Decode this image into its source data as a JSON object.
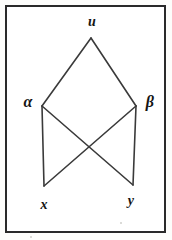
{
  "figure": {
    "type": "graph-diagram",
    "background_color": "#ffffff",
    "frame": {
      "border_color": "#2a2a2a",
      "border_width_px": 2,
      "x": 5,
      "y": 5,
      "width": 161,
      "height": 228
    },
    "edge_color": "#3a3a3a",
    "edge_width_px": 1.6,
    "nodes": [
      {
        "id": "u",
        "label": "u",
        "script": "latin",
        "x": 91,
        "y": 38,
        "label_x": 92,
        "label_y": 22
      },
      {
        "id": "alpha",
        "label": "α",
        "script": "greek",
        "x": 42,
        "y": 106,
        "label_x": 28,
        "label_y": 102
      },
      {
        "id": "beta",
        "label": "β",
        "script": "greek",
        "x": 136,
        "y": 106,
        "label_x": 150,
        "label_y": 102
      },
      {
        "id": "x",
        "label": "x",
        "script": "latin",
        "x": 44,
        "y": 186,
        "label_x": 44,
        "label_y": 205
      },
      {
        "id": "y",
        "label": "y",
        "script": "latin",
        "x": 133,
        "y": 185,
        "label_x": 131,
        "label_y": 201
      }
    ],
    "edges": [
      {
        "id": "edge-u-alpha",
        "from": "u",
        "to": "alpha"
      },
      {
        "id": "edge-u-beta",
        "from": "u",
        "to": "beta"
      },
      {
        "id": "edge-alpha-x",
        "from": "alpha",
        "to": "x"
      },
      {
        "id": "edge-alpha-y",
        "from": "alpha",
        "to": "y"
      },
      {
        "id": "edge-beta-y",
        "from": "beta",
        "to": "y"
      },
      {
        "id": "edge-beta-x",
        "from": "beta",
        "to": "x"
      }
    ],
    "crossing_point": {
      "x": 89,
      "y": 145
    }
  }
}
